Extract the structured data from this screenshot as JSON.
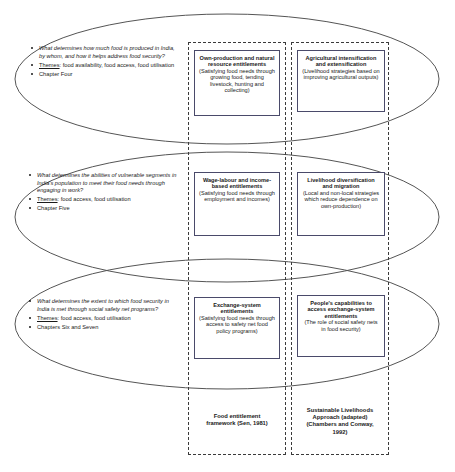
{
  "diagram": {
    "colors": {
      "ellipse_stroke": "#555555",
      "dashed_border": "#3a3a3a",
      "box_border": "#4a4a6a",
      "text": "#1a1a1a",
      "background": "#ffffff"
    }
  },
  "columns": [
    {
      "id": "entitlement",
      "caption_line1": "Food entitlement",
      "caption_line2": "framework (Sen, 1981)"
    },
    {
      "id": "livelihoods",
      "caption_line1": "Sustainable Livelihoods",
      "caption_line2": "Approach (adapted)",
      "caption_line3": "(Chambers and Conway,",
      "caption_line4": "1992)"
    }
  ],
  "rows": [
    {
      "id": "row-one",
      "question": "What determines how much food is produced in India, by whom, and how it helps address food security?",
      "themes_label": "Themes",
      "themes_value": ": food availability, food access, food utilisation",
      "chapter": "Chapter Four",
      "entitlement_box": {
        "title": "Own-production and natural resource entitlements",
        "subtitle": "(Satisfying food needs through growing food, tending livestock, hunting and collecting)"
      },
      "livelihoods_box": {
        "title": "Agricultural intensification and extensification",
        "subtitle": "(Livelihood strategies based on improving agricultural outputs)"
      }
    },
    {
      "id": "row-two",
      "question": "What determines the abilities of vulnerable segments in India's population to meet their food needs through engaging in work?",
      "themes_label": "Themes",
      "themes_value": ": food access, food utilisation",
      "chapter": "Chapter Five",
      "entitlement_box": {
        "title": "Wage-labour and income-based entitlements",
        "subtitle": "(Satisfying food needs through employment and incomes)"
      },
      "livelihoods_box": {
        "title": "Livelihood diversification and migration",
        "subtitle": "(Local and non-local strategies which reduce dependence on own-production)"
      }
    },
    {
      "id": "row-three",
      "question": "What determines the extent to which food security in India is met through social safety net programs?",
      "themes_label": "Themes",
      "themes_value": ": food access, food utilisation",
      "chapter": "Chapters Six and Seven",
      "entitlement_box": {
        "title": "Exchange-system entitlements",
        "subtitle": "(Satisfying food needs through access to safety net food policy programs)"
      },
      "livelihoods_box": {
        "title": "People's capabilities to access exchange-system entitlements",
        "subtitle": "(The role of social safety nets in food security)"
      }
    }
  ]
}
